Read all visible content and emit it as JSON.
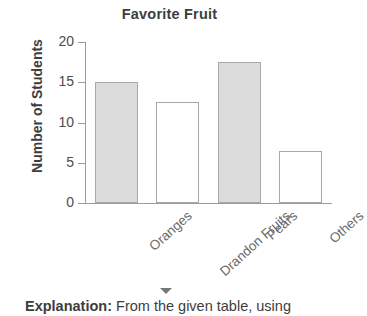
{
  "chart_data": {
    "type": "bar",
    "title": "Favorite Fruit",
    "xlabel": "",
    "ylabel": "Number of Students",
    "categories": [
      "Oranges",
      "Drandon Fruits",
      "Pears",
      "Others"
    ],
    "values": [
      15,
      12.5,
      17.5,
      6.5
    ],
    "bar_styles": [
      "filled",
      "hollow",
      "filled",
      "hollow"
    ],
    "fill_color": "#dcdcdc",
    "edge_color": "#a8a8a8",
    "ylim": [
      0,
      20
    ],
    "yticks": [
      0,
      5,
      10,
      15,
      20
    ],
    "ytick_labels": [
      "0",
      "5",
      "10",
      "15",
      "20"
    ],
    "grid": false,
    "legend": null
  },
  "footer": {
    "label": "Explanation:",
    "text": " From the given table, using"
  },
  "icons": {
    "caret": "chevron-down-icon"
  }
}
